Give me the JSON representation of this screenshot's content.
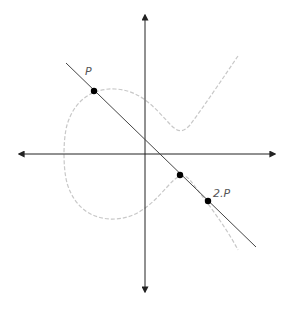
{
  "diagram": {
    "labels": {
      "p": "P",
      "two_p": "2.P"
    },
    "colors": {
      "axis": "#222222",
      "line": "#444444",
      "curve": "#c8c8c8",
      "point": "#000000",
      "label": "#555555"
    },
    "points": [
      {
        "name": "P",
        "x": 94,
        "y": 91
      },
      {
        "name": "intersection",
        "x": 180,
        "y": 175
      },
      {
        "name": "2.P",
        "x": 208,
        "y": 201
      }
    ]
  }
}
